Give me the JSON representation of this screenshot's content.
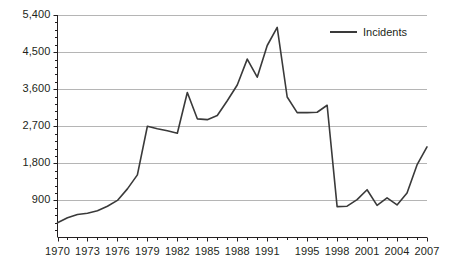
{
  "chart_data": {
    "type": "line",
    "title": "",
    "xlabel": "",
    "ylabel": "",
    "ylim": [
      0,
      5400
    ],
    "xlim": [
      1970,
      2007
    ],
    "grid": true,
    "legend_position": "top-right",
    "y_ticks": [
      "900",
      "1,800",
      "2,700",
      "3,600",
      "4,500",
      "5,400"
    ],
    "y_tick_values": [
      900,
      1800,
      2700,
      3600,
      4500,
      5400
    ],
    "y_minor_ticks_per_major": 5,
    "x_ticks": [
      "1970",
      "1973",
      "1976",
      "1979",
      "1982",
      "1985",
      "1988",
      "1991",
      "1995",
      "1998",
      "2001",
      "2004",
      "2007"
    ],
    "x_tick_values": [
      1970,
      1973,
      1976,
      1979,
      1982,
      1985,
      1988,
      1991,
      1995,
      1998,
      2001,
      2004,
      2007
    ],
    "series": [
      {
        "name": "Incidents",
        "color": "#3a3a3a",
        "x": [
          1970,
          1971,
          1972,
          1973,
          1974,
          1975,
          1976,
          1977,
          1978,
          1979,
          1980,
          1981,
          1982,
          1983,
          1984,
          1985,
          1986,
          1987,
          1988,
          1989,
          1990,
          1991,
          1992,
          1993,
          1994,
          1995,
          1996,
          1997,
          1998,
          1999,
          2000,
          2001,
          2002,
          2003,
          2004,
          2005,
          2006,
          2007
        ],
        "values": [
          360,
          480,
          560,
          590,
          650,
          760,
          900,
          1180,
          1520,
          2700,
          2640,
          2590,
          2530,
          3520,
          2880,
          2860,
          2960,
          3320,
          3700,
          4330,
          3890,
          4660,
          5100,
          3410,
          3030,
          3030,
          3040,
          3210,
          750,
          760,
          920,
          1160,
          780,
          960,
          790,
          1080,
          1760,
          2200
        ]
      }
    ],
    "legend": [
      {
        "label": "Incidents",
        "color": "#3a3a3a"
      }
    ]
  },
  "axes": {
    "gridline_color": "#b5b5b5",
    "axis_color": "#231f20",
    "tick_color": "#231f20"
  }
}
